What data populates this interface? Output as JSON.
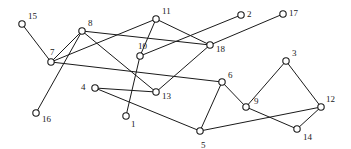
{
  "figure": {
    "kind": "node-link-graph",
    "width": 351,
    "height": 149,
    "background_color": "#ffffff",
    "stroke_color": "#1a1a1a",
    "node_fill_color": "#ffffff",
    "node_radius": 3.2,
    "label_font_size": 9
  },
  "chart_data": {
    "type": "scatter",
    "title": "",
    "xlabel": "",
    "ylabel": "",
    "grid": false,
    "legend": null,
    "xlim": [
      0,
      351
    ],
    "ylim": [
      0,
      149
    ],
    "nodes": [
      {
        "id": "15",
        "label": "15",
        "x": 22,
        "y": 24,
        "label_dx": 6,
        "label_dy": -12
      },
      {
        "id": "8",
        "label": "8",
        "x": 82,
        "y": 31,
        "label_dx": 6,
        "label_dy": -12
      },
      {
        "id": "11",
        "label": "11",
        "x": 156,
        "y": 19,
        "label_dx": 6,
        "label_dy": -12
      },
      {
        "id": "2",
        "label": "2",
        "x": 241,
        "y": 15,
        "label_dx": 6,
        "label_dy": -5
      },
      {
        "id": "17",
        "label": "17",
        "x": 283,
        "y": 14,
        "label_dx": 6,
        "label_dy": -5
      },
      {
        "id": "7",
        "label": "7",
        "x": 51,
        "y": 62,
        "label_dx": -1,
        "label_dy": -14
      },
      {
        "id": "10",
        "label": "10",
        "x": 140,
        "y": 56,
        "label_dx": -2,
        "label_dy": -14
      },
      {
        "id": "18",
        "label": "18",
        "x": 210,
        "y": 45,
        "label_dx": 6,
        "label_dy": 0
      },
      {
        "id": "3",
        "label": "3",
        "x": 286,
        "y": 61,
        "label_dx": 6,
        "label_dy": -12
      },
      {
        "id": "6",
        "label": "6",
        "x": 222,
        "y": 82,
        "label_dx": 6,
        "label_dy": -11
      },
      {
        "id": "4",
        "label": "4",
        "x": 95,
        "y": 88,
        "label_dx": -14,
        "label_dy": -5
      },
      {
        "id": "13",
        "label": "13",
        "x": 156,
        "y": 92,
        "label_dx": 6,
        "label_dy": 0
      },
      {
        "id": "9",
        "label": "9",
        "x": 246,
        "y": 107,
        "label_dx": 8,
        "label_dy": -10
      },
      {
        "id": "12",
        "label": "12",
        "x": 321,
        "y": 107,
        "label_dx": 5,
        "label_dy": -12
      },
      {
        "id": "16",
        "label": "16",
        "x": 36,
        "y": 113,
        "label_dx": 6,
        "label_dy": 2
      },
      {
        "id": "1",
        "label": "1",
        "x": 126,
        "y": 116,
        "label_dx": 5,
        "label_dy": 4
      },
      {
        "id": "14",
        "label": "14",
        "x": 297,
        "y": 129,
        "label_dx": 6,
        "label_dy": 4
      },
      {
        "id": "5",
        "label": "5",
        "x": 200,
        "y": 131,
        "label_dx": 1,
        "label_dy": 10
      }
    ],
    "edges": [
      {
        "source": "15",
        "target": "7"
      },
      {
        "source": "7",
        "target": "8"
      },
      {
        "source": "8",
        "target": "16"
      },
      {
        "source": "8",
        "target": "18"
      },
      {
        "source": "8",
        "target": "13"
      },
      {
        "source": "7",
        "target": "11"
      },
      {
        "source": "7",
        "target": "6"
      },
      {
        "source": "11",
        "target": "10"
      },
      {
        "source": "11",
        "target": "18"
      },
      {
        "source": "10",
        "target": "2"
      },
      {
        "source": "10",
        "target": "1"
      },
      {
        "source": "18",
        "target": "17"
      },
      {
        "source": "18",
        "target": "13"
      },
      {
        "source": "4",
        "target": "13"
      },
      {
        "source": "4",
        "target": "5"
      },
      {
        "source": "5",
        "target": "6"
      },
      {
        "source": "5",
        "target": "12"
      },
      {
        "source": "6",
        "target": "9"
      },
      {
        "source": "9",
        "target": "3"
      },
      {
        "source": "9",
        "target": "14"
      },
      {
        "source": "3",
        "target": "12"
      },
      {
        "source": "12",
        "target": "14"
      }
    ]
  }
}
